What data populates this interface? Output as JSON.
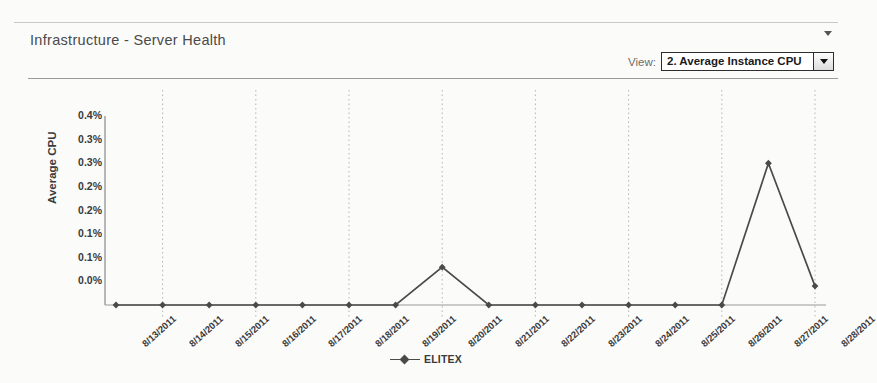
{
  "panel": {
    "title": "Infrastructure - Server Health",
    "collapse_icon": "chevron-down-icon"
  },
  "view_selector": {
    "label": "View:",
    "selected": "2. Average Instance CPU",
    "arrow_icon": "chevron-down-icon"
  },
  "chart_data": {
    "type": "line",
    "title": "",
    "xlabel": "",
    "ylabel": "Average CPU",
    "ylim": [
      0,
      0.4
    ],
    "ytick_values": [
      0.4,
      0.35,
      0.3,
      0.25,
      0.2,
      0.15,
      0.1,
      0.05,
      0
    ],
    "ytick_labels": [
      "0.4%",
      "0.3%",
      "0.3%",
      "0.2%",
      "0.2%",
      "0.1%",
      "0.1%",
      "0.0%"
    ],
    "grid": "vertical-dotted",
    "legend_position": "bottom",
    "categories": [
      "8/13/2011",
      "8/14/2011",
      "8/15/2011",
      "8/16/2011",
      "8/17/2011",
      "8/18/2011",
      "8/19/2011",
      "8/20/2011",
      "8/21/2011",
      "8/22/2011",
      "8/23/2011",
      "8/24/2011",
      "8/25/2011",
      "8/26/2011",
      "8/27/2011",
      "8/28/2011"
    ],
    "series": [
      {
        "name": "ELITEX",
        "color": "#4a4a4a",
        "marker": "diamond",
        "values": [
          0,
          0,
          0,
          0,
          0,
          0,
          0,
          0.08,
          0,
          0,
          0,
          0,
          0,
          0,
          0.3,
          0.04
        ]
      }
    ]
  }
}
